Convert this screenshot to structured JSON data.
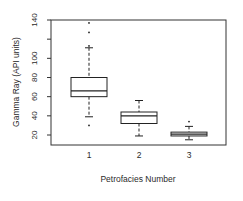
{
  "chart_data": {
    "type": "box",
    "title": "",
    "xlabel": "Petrofacies Number",
    "ylabel": "Gamma Ray (API units)",
    "ylim": [
      14,
      140
    ],
    "yticks": [
      20,
      40,
      60,
      80,
      100,
      120,
      140
    ],
    "ytick_labels": [
      "20",
      "40",
      "60",
      "80",
      "100",
      "",
      "140"
    ],
    "categories": [
      "1",
      "2",
      "3"
    ],
    "grid": false,
    "legend": null,
    "series": [
      {
        "name": "1",
        "whisker_low": 39,
        "q1": 60,
        "median": 66,
        "q3": 80,
        "whisker_high": 111,
        "outliers": [
          30,
          113,
          127,
          137
        ]
      },
      {
        "name": "2",
        "whisker_low": 19,
        "q1": 32,
        "median": 40,
        "q3": 44,
        "whisker_high": 56,
        "outliers": []
      },
      {
        "name": "3",
        "whisker_low": 15,
        "q1": 19,
        "median": 21,
        "q3": 23,
        "whisker_high": 29,
        "outliers": [
          34
        ]
      }
    ]
  }
}
